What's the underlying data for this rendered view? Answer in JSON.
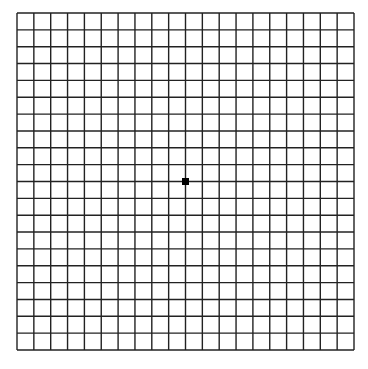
{
  "grid": {
    "title": "Amsler grid",
    "columns": 20,
    "rows": 20,
    "left": 17,
    "top": 13,
    "cell_size": 16.85,
    "line_color": "#222222",
    "line_width": 1.4,
    "background": "#ffffff"
  },
  "fixation_dot": {
    "color": "#000000",
    "size": 7
  }
}
